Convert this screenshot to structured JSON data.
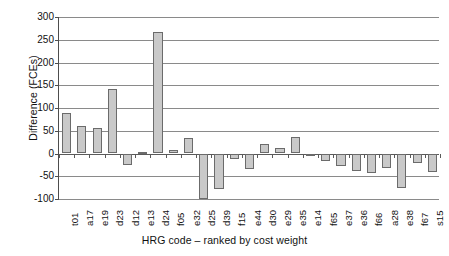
{
  "chart_data": {
    "type": "bar",
    "title": "",
    "subtitle": "",
    "xlabel": "HRG code – ranked by cost weight",
    "ylabel": "Difference (FCEs)",
    "ylim": [
      -100,
      300
    ],
    "ytick_step": 50,
    "yticks": [
      300,
      250,
      200,
      150,
      100,
      50,
      0,
      -50,
      -100
    ],
    "ytick_labels": [
      "300",
      "250",
      "200",
      "150",
      "100",
      "50",
      "0",
      "-50",
      "-100"
    ],
    "grid": "horizontal",
    "legend": "none",
    "bar_fill_color": "#c9c9c9",
    "bar_border_color": "#6b6b6b",
    "axis_color": "#4d4d4d",
    "gridline_color": "#8a8a8a",
    "background_color": "#ffffff",
    "categories": [
      "t01",
      "a17",
      "e19",
      "d23",
      "d12",
      "e13",
      "d24",
      "f05",
      "e32",
      "d25",
      "d39",
      "f15",
      "e44",
      "d30",
      "e29",
      "e35",
      "e14",
      "f65",
      "e37",
      "e36",
      "f66",
      "a28",
      "e38",
      "f67",
      "s15"
    ],
    "values": [
      88,
      61,
      56,
      141,
      -26,
      4,
      267,
      8,
      33,
      -100,
      -78,
      -12,
      -35,
      20,
      11,
      36,
      -5,
      -17,
      -27,
      -38,
      -42,
      -31,
      -75,
      -20,
      -41
    ]
  }
}
